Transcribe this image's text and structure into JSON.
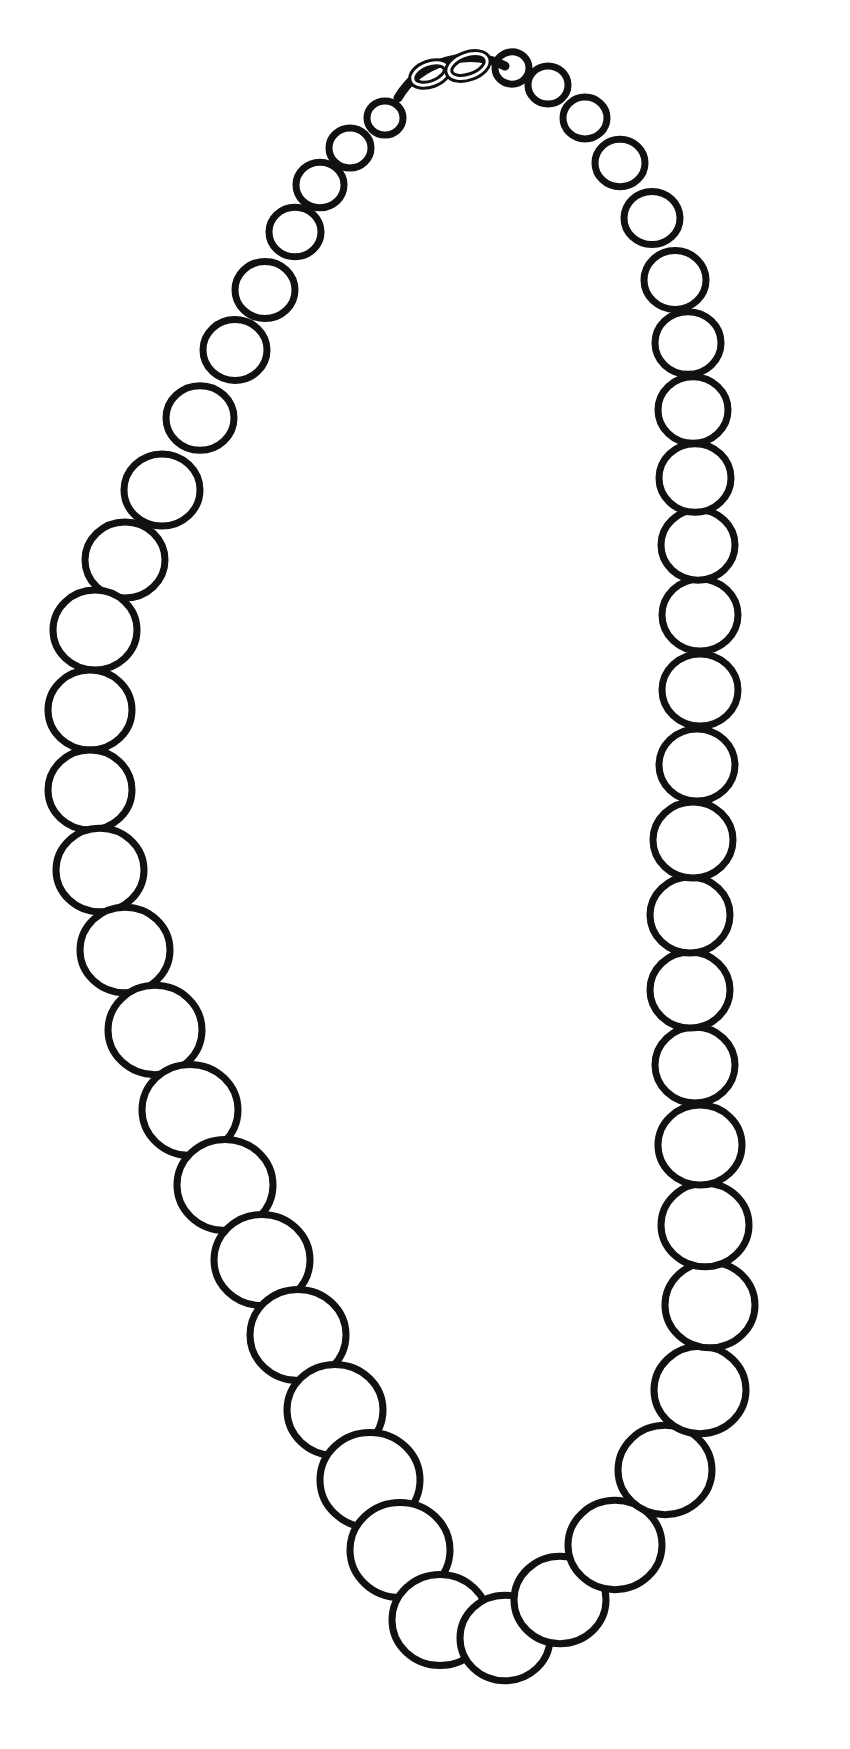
{
  "image": {
    "subject": "pearl necklace line drawing",
    "background": "#ffffff",
    "stroke": "#111111"
  },
  "beads": [
    [
      385,
      118,
      18
    ],
    [
      350,
      148,
      21
    ],
    [
      320,
      185,
      24
    ],
    [
      295,
      232,
      26
    ],
    [
      265,
      290,
      30
    ],
    [
      235,
      350,
      32
    ],
    [
      200,
      418,
      34
    ],
    [
      162,
      490,
      38
    ],
    [
      125,
      560,
      40
    ],
    [
      95,
      630,
      42
    ],
    [
      90,
      710,
      42
    ],
    [
      90,
      790,
      42
    ],
    [
      100,
      870,
      44
    ],
    [
      125,
      950,
      45
    ],
    [
      155,
      1030,
      47
    ],
    [
      190,
      1110,
      48
    ],
    [
      225,
      1185,
      48
    ],
    [
      262,
      1260,
      48
    ],
    [
      298,
      1335,
      48
    ],
    [
      335,
      1410,
      48
    ],
    [
      370,
      1480,
      50
    ],
    [
      400,
      1550,
      50
    ],
    [
      440,
      1620,
      48
    ],
    [
      505,
      1638,
      45
    ],
    [
      560,
      1600,
      46
    ],
    [
      615,
      1545,
      47
    ],
    [
      665,
      1470,
      47
    ],
    [
      700,
      1390,
      46
    ],
    [
      710,
      1305,
      45
    ],
    [
      705,
      1225,
      44
    ],
    [
      700,
      1145,
      42
    ],
    [
      695,
      1065,
      40
    ],
    [
      690,
      990,
      40
    ],
    [
      690,
      915,
      40
    ],
    [
      693,
      840,
      40
    ],
    [
      697,
      765,
      38
    ],
    [
      700,
      690,
      38
    ],
    [
      700,
      615,
      38
    ],
    [
      698,
      545,
      37
    ],
    [
      695,
      478,
      36
    ],
    [
      693,
      410,
      35
    ],
    [
      688,
      343,
      33
    ],
    [
      675,
      280,
      31
    ],
    [
      652,
      218,
      28
    ],
    [
      620,
      163,
      25
    ],
    [
      585,
      118,
      22
    ],
    [
      548,
      85,
      20
    ],
    [
      512,
      68,
      17
    ]
  ],
  "clasp": {
    "path": "M398 98 C 420 60, 470 48, 505 66",
    "links": [
      [
        430,
        74,
        18,
        10
      ],
      [
        468,
        66,
        20,
        11
      ]
    ]
  }
}
